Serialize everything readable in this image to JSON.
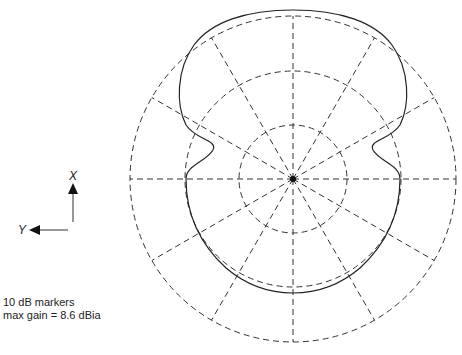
{
  "axes": {
    "x_label": "X",
    "y_label": "Y"
  },
  "legend": {
    "line1": "10 dB markers",
    "line2": "max gain = 8.6 dBia"
  },
  "chart_data": {
    "type": "polar",
    "center_px": [
      293,
      179
    ],
    "rings": [
      {
        "label": "-20 dB",
        "radius_px": 54
      },
      {
        "label": "-10 dB",
        "radius_px": 108
      },
      {
        "label": "0 dB (max)",
        "radius_px": 163
      }
    ],
    "ring_step_db": 10,
    "spokes_deg": [
      0,
      30,
      60,
      90,
      120,
      150,
      180,
      210,
      240,
      270,
      300,
      330
    ],
    "max_gain_dbi": 8.6,
    "pattern_description": "Main lobe toward +X reaching the outer ring; side notches near ±70°; back half follows approximately the -10 dB ring",
    "grid": true,
    "colors": {
      "grid": "#333333",
      "pattern": "#222222",
      "background": "#ffffff"
    }
  }
}
